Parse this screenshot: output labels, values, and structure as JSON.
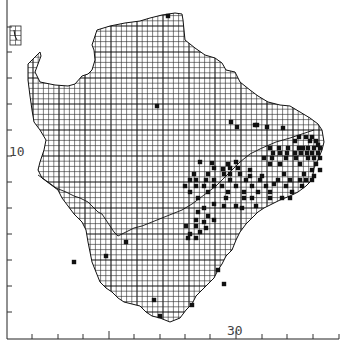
{
  "map": {
    "title": "Distribution map",
    "grid_cell_px": 5.2,
    "major_every_cells": 5,
    "axes": {
      "y_axis": {
        "x": 7,
        "top": 0,
        "bottom": 339,
        "ticks": [
          27,
          52,
          78,
          104,
          130,
          156,
          182,
          208,
          234,
          260,
          286,
          312
        ],
        "label": "10",
        "label_pos": [
          9,
          156
        ]
      },
      "x_axis": {
        "y": 339,
        "left": 7,
        "right": 339,
        "ticks": [
          32,
          58,
          83,
          109,
          134,
          160,
          185,
          210,
          236,
          262,
          287,
          313,
          339
        ],
        "label": "30",
        "label_pos": [
          227,
          335
        ]
      }
    },
    "colors": {
      "ink": "#111111",
      "background": "#ffffff"
    },
    "outline": "M28,64 L40,52 L41,56 L35,72 L40,82 L55,85 L68,86 L75,84 L82,76 L88,74 L92,70 L95,60 L94,50 L92,45 L95,36 L97,30 L110,26 L125,23 L140,21 L150,18 L162,15 L175,13 L182,14 L183,20 L185,40 L195,48 L205,55 L215,58 L222,63 L226,70 L235,72 L240,82 L250,90 L258,96 L268,102 L280,105 L290,106 L300,112 L310,118 L318,124 L322,130 L324,142 L322,150 L318,160 L314,168 L312,180 L306,186 L298,192 L290,196 L280,200 L272,204 L264,208 L258,212 L252,218 L246,224 L240,232 L236,240 L232,250 L226,256 L222,264 L218,270 L214,278 L208,284 L202,290 L196,296 L192,304 L186,310 L180,318 L170,322 L160,318 L152,316 L146,312 L140,306 L132,304 L124,302 L118,298 L112,292 L106,288 L100,282 L96,272 L92,262 L90,252 L88,242 L86,230 L82,222 L74,214 L68,206 L62,198 L58,190 L50,184 L42,178 L38,170 L40,162 L44,150 L46,140 L40,130 L34,122 L32,110 L30,96 L28,80 Z",
    "inner_border": "M38,175 L48,182 L56,188 L66,192 L74,196 L80,198 L88,202 L94,208 L98,212 L102,214 L106,220 L110,226 L114,232 L118,236 L126,232 L134,228 L142,226 L152,222 L162,218 L172,214 L182,210 L192,204 L200,198 L208,192 L216,186 L222,180 L230,172 L240,162 L250,154 L262,148 L276,142 L290,138 L302,134 L314,130",
    "inset": {
      "x": 10,
      "y": 26,
      "w": 11,
      "h": 19
    },
    "dots": [
      [
        168,
        16
      ],
      [
        157,
        106
      ],
      [
        231,
        122
      ],
      [
        237,
        127
      ],
      [
        255,
        125
      ],
      [
        257,
        125
      ],
      [
        267,
        127
      ],
      [
        283,
        128
      ],
      [
        299,
        137
      ],
      [
        295,
        141
      ],
      [
        306,
        137
      ],
      [
        312,
        137
      ],
      [
        310,
        141
      ],
      [
        316,
        141
      ],
      [
        318,
        145
      ],
      [
        270,
        148
      ],
      [
        279,
        148
      ],
      [
        288,
        148
      ],
      [
        299,
        148
      ],
      [
        303,
        148
      ],
      [
        308,
        148
      ],
      [
        314,
        148
      ],
      [
        320,
        148
      ],
      [
        273,
        153
      ],
      [
        280,
        153
      ],
      [
        287,
        153
      ],
      [
        295,
        153
      ],
      [
        301,
        153
      ],
      [
        307,
        153
      ],
      [
        312,
        153
      ],
      [
        318,
        153
      ],
      [
        264,
        158
      ],
      [
        272,
        158
      ],
      [
        286,
        158
      ],
      [
        296,
        158
      ],
      [
        308,
        158
      ],
      [
        314,
        158
      ],
      [
        320,
        158
      ],
      [
        200,
        162
      ],
      [
        212,
        163
      ],
      [
        228,
        164
      ],
      [
        236,
        162
      ],
      [
        270,
        164
      ],
      [
        280,
        164
      ],
      [
        300,
        164
      ],
      [
        316,
        164
      ],
      [
        214,
        168
      ],
      [
        223,
        169
      ],
      [
        230,
        168
      ],
      [
        238,
        168
      ],
      [
        250,
        170
      ],
      [
        312,
        170
      ],
      [
        320,
        170
      ],
      [
        194,
        174
      ],
      [
        208,
        174
      ],
      [
        224,
        174
      ],
      [
        230,
        174
      ],
      [
        240,
        174
      ],
      [
        250,
        176
      ],
      [
        262,
        176
      ],
      [
        284,
        174
      ],
      [
        304,
        174
      ],
      [
        314,
        176
      ],
      [
        190,
        180
      ],
      [
        196,
        180
      ],
      [
        206,
        180
      ],
      [
        214,
        180
      ],
      [
        230,
        180
      ],
      [
        246,
        180
      ],
      [
        260,
        180
      ],
      [
        278,
        180
      ],
      [
        290,
        180
      ],
      [
        300,
        180
      ],
      [
        306,
        180
      ],
      [
        312,
        180
      ],
      [
        185,
        186
      ],
      [
        196,
        186
      ],
      [
        204,
        186
      ],
      [
        214,
        186
      ],
      [
        222,
        186
      ],
      [
        236,
        186
      ],
      [
        252,
        186
      ],
      [
        266,
        186
      ],
      [
        274,
        184
      ],
      [
        286,
        186
      ],
      [
        302,
        186
      ],
      [
        190,
        192
      ],
      [
        208,
        192
      ],
      [
        228,
        192
      ],
      [
        244,
        192
      ],
      [
        258,
        192
      ],
      [
        270,
        192
      ],
      [
        292,
        192
      ],
      [
        198,
        198
      ],
      [
        226,
        198
      ],
      [
        244,
        198
      ],
      [
        252,
        198
      ],
      [
        270,
        198
      ],
      [
        282,
        198
      ],
      [
        290,
        198
      ],
      [
        214,
        204
      ],
      [
        224,
        206
      ],
      [
        236,
        206
      ],
      [
        242,
        208
      ],
      [
        256,
        206
      ],
      [
        198,
        212
      ],
      [
        204,
        208
      ],
      [
        208,
        216
      ],
      [
        196,
        220
      ],
      [
        204,
        222
      ],
      [
        214,
        220
      ],
      [
        186,
        226
      ],
      [
        196,
        226
      ],
      [
        206,
        228
      ],
      [
        190,
        234
      ],
      [
        200,
        232
      ],
      [
        188,
        238
      ],
      [
        196,
        238
      ],
      [
        126,
        242
      ],
      [
        74,
        262
      ],
      [
        106,
        256
      ],
      [
        218,
        270
      ],
      [
        224,
        284
      ],
      [
        154,
        300
      ],
      [
        160,
        316
      ],
      [
        192,
        305
      ]
    ]
  }
}
